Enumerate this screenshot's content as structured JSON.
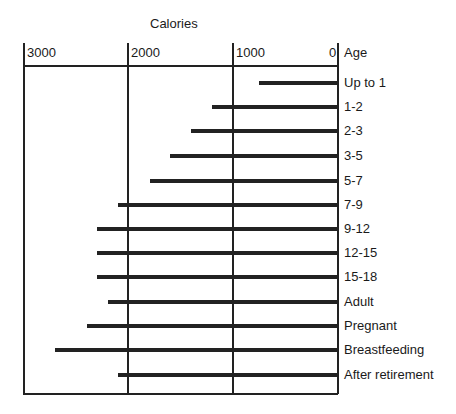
{
  "chart_data": {
    "type": "bar",
    "orientation": "horizontal",
    "title": "Calories",
    "xlabel": "Calories",
    "ylabel": "Age",
    "xlim": [
      3000,
      0
    ],
    "x_ticks": [
      "3000",
      "2000",
      "1000",
      "0"
    ],
    "grid": true,
    "categories": [
      "Up to 1",
      "1-2",
      "2-3",
      "3-5",
      "5-7",
      "7-9",
      "9-12",
      "12-15",
      "15-18",
      "Adult",
      "Pregnant",
      "Breastfeeding",
      "After retirement"
    ],
    "values": [
      750,
      1200,
      1400,
      1600,
      1800,
      2100,
      2300,
      2300,
      2300,
      2200,
      2400,
      2700,
      2100
    ]
  },
  "labels": {
    "title": "Calories",
    "age_header": "Age",
    "ticks": [
      "3000",
      "2000",
      "1000",
      "0"
    ]
  }
}
